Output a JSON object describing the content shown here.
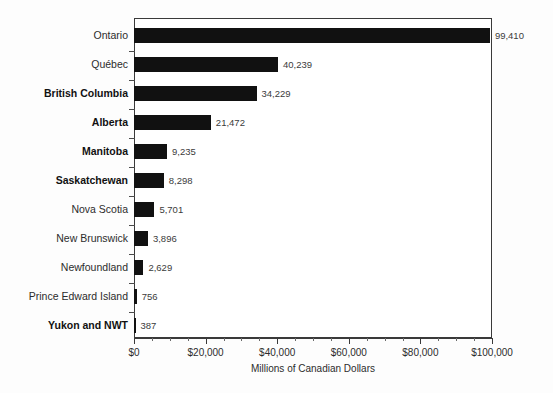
{
  "chart_data": {
    "type": "bar",
    "orientation": "horizontal",
    "title": "",
    "xlabel": "Millions of Canadian Dollars",
    "ylabel": "",
    "xlim": [
      0,
      100000
    ],
    "grid": false,
    "legend": false,
    "axis_tick_labels": [
      "$0",
      "$20,000",
      "$40,000",
      "$60,000",
      "$80,000",
      "$100,000"
    ],
    "axis_tick_values": [
      0,
      20000,
      40000,
      60000,
      80000,
      100000
    ],
    "minor_tick_interval": 5000,
    "bar_color": "#111111",
    "categories": [
      "Ontario",
      "Québec",
      "British Columbia",
      "Alberta",
      "Manitoba",
      "Saskatchewan",
      "Nova Scotia",
      "New Brunswick",
      "Newfoundland",
      "Prince Edward Island",
      "Yukon and NWT"
    ],
    "values": [
      99410,
      40239,
      34229,
      21472,
      9235,
      8298,
      5701,
      3896,
      2629,
      756,
      387
    ],
    "value_labels": [
      "99,410",
      "40,239",
      "34,229",
      "21,472",
      "9,235",
      "8,298",
      "5,701",
      "3,896",
      "2,629",
      "756",
      "387"
    ],
    "category_bold": [
      false,
      false,
      true,
      true,
      true,
      true,
      false,
      false,
      false,
      false,
      true
    ]
  }
}
